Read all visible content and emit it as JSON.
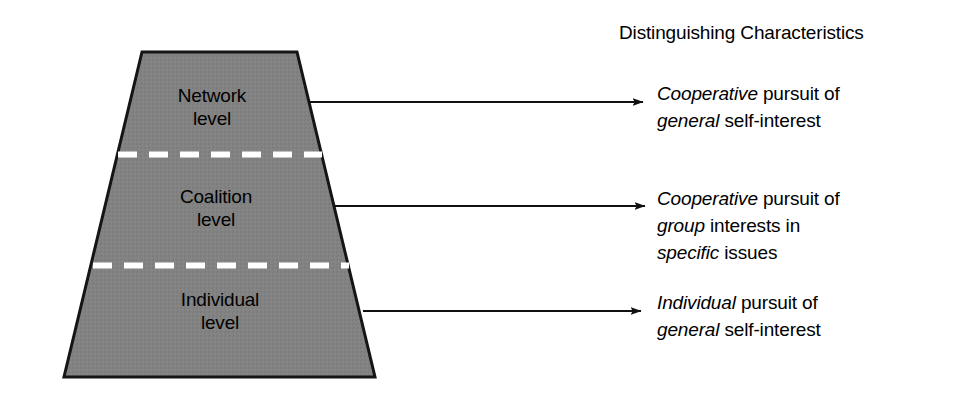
{
  "figure": {
    "title": "Distinguishing Characteristics",
    "shape": {
      "name": "trapezoid-pyramid",
      "fill_color": "#808080",
      "stroke_color": "#1a1a1a",
      "divider_color": "#ffffff"
    },
    "levels": [
      {
        "id": "network",
        "label": "Network\nlevel"
      },
      {
        "id": "coalition",
        "label": "Coalition\nlevel"
      },
      {
        "id": "individual",
        "label": "Individual\nlevel"
      }
    ],
    "annotations": [
      {
        "id": "network-characteristic",
        "lines": [
          [
            {
              "text": "Cooperative",
              "italic": true
            },
            {
              "text": " pursuit of",
              "italic": false
            }
          ],
          [
            {
              "text": "general",
              "italic": true
            },
            {
              "text": " self-interest",
              "italic": false
            }
          ]
        ]
      },
      {
        "id": "coalition-characteristic",
        "lines": [
          [
            {
              "text": "Cooperative",
              "italic": true
            },
            {
              "text": " pursuit of",
              "italic": false
            }
          ],
          [
            {
              "text": "group",
              "italic": true
            },
            {
              "text": " interests in",
              "italic": false
            }
          ],
          [
            {
              "text": "specific",
              "italic": true
            },
            {
              "text": " issues",
              "italic": false
            }
          ]
        ]
      },
      {
        "id": "individual-characteristic",
        "lines": [
          [
            {
              "text": "Individual",
              "italic": true
            },
            {
              "text": " pursuit of",
              "italic": false
            }
          ],
          [
            {
              "text": "general",
              "italic": true
            },
            {
              "text": " self-interest",
              "italic": false
            }
          ]
        ]
      }
    ],
    "arrows": [
      {
        "id": "arrow-network",
        "x1": 308,
        "y1": 102,
        "x2": 645,
        "y2": 102
      },
      {
        "id": "arrow-coalition",
        "x1": 335,
        "y1": 206,
        "x2": 647,
        "y2": 206
      },
      {
        "id": "arrow-individual",
        "x1": 363,
        "y1": 311,
        "x2": 643,
        "y2": 311
      }
    ]
  }
}
